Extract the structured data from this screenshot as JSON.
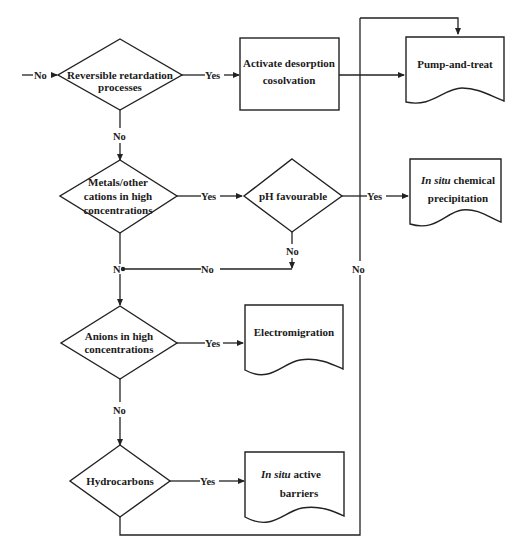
{
  "diagram": {
    "type": "flowchart",
    "nodes": {
      "reversible": {
        "kind": "decision",
        "lines": [
          "Reversible retardation",
          "processes"
        ]
      },
      "activate": {
        "kind": "process",
        "lines": [
          "Activate desorption",
          "cosolvation"
        ]
      },
      "pump": {
        "kind": "document",
        "lines": [
          "Pump-and-treat"
        ]
      },
      "metals": {
        "kind": "decision",
        "lines": [
          "Metals/other",
          "cations in high",
          "concentrations"
        ]
      },
      "ph": {
        "kind": "decision",
        "lines": [
          "pH favourable"
        ]
      },
      "chemprecip": {
        "kind": "document",
        "italic": "In situ",
        "lines": [
          " chemical",
          "precipitation"
        ]
      },
      "anions": {
        "kind": "decision",
        "lines": [
          "Anions in high",
          "concentrations"
        ]
      },
      "electro": {
        "kind": "document",
        "lines": [
          "Electromigration"
        ]
      },
      "hydro": {
        "kind": "decision",
        "lines": [
          "Hydrocarbons"
        ]
      },
      "barriers": {
        "kind": "document",
        "italic": "In situ",
        "lines": [
          " active",
          "barriers"
        ]
      }
    },
    "edge_labels": {
      "entry_no": "No",
      "reversible_yes": "Yes",
      "reversible_no": "No",
      "metals_yes": "Yes",
      "ph_yes": "Yes",
      "ph_no": "No",
      "merge_no": "No",
      "merge_junction": "N",
      "anions_yes": "Yes",
      "anions_no": "No",
      "hydro_yes": "Yes",
      "loop_no": "No"
    },
    "edges": [
      {
        "from": "entry",
        "to": "reversible",
        "label": "No"
      },
      {
        "from": "reversible",
        "to": "activate",
        "label": "Yes"
      },
      {
        "from": "activate",
        "to": "pump"
      },
      {
        "from": "reversible",
        "to": "metals",
        "label": "No"
      },
      {
        "from": "metals",
        "to": "ph",
        "label": "Yes"
      },
      {
        "from": "ph",
        "to": "chemprecip",
        "label": "Yes"
      },
      {
        "from": "ph",
        "to": "junction",
        "label": "No"
      },
      {
        "from": "metals",
        "to": "anions",
        "label": "No"
      },
      {
        "from": "anions",
        "to": "electro",
        "label": "Yes"
      },
      {
        "from": "anions",
        "to": "hydro",
        "label": "No"
      },
      {
        "from": "hydro",
        "to": "barriers",
        "label": "Yes"
      },
      {
        "from": "hydro",
        "to": "pump",
        "label": "No"
      }
    ]
  }
}
